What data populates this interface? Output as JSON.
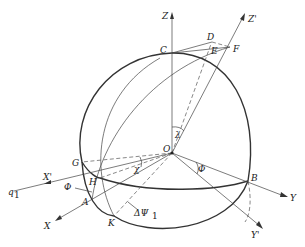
{
  "figure": {
    "type": "spherical-geometry-diagram",
    "points": {
      "O": "O",
      "A": "A",
      "B": "B",
      "C": "C",
      "D": "D",
      "E": "E",
      "F": "F",
      "G": "G",
      "H": "H",
      "K": "K"
    },
    "axes": {
      "X": "X",
      "Y": "Y",
      "Z": "Z",
      "X_prime": "X'",
      "Y_prime": "Y'",
      "Z_prime": "Z'"
    },
    "vector": {
      "q1": "q",
      "q1_sub": "1"
    },
    "angles": {
      "lambda": "λ",
      "phi_left": "Φ",
      "phi_right": "Φ",
      "chi": "χ",
      "delta_psi": "ΔΨ",
      "delta_psi_sub": "1"
    },
    "colors": {
      "line": "#333333",
      "background": "#ffffff"
    }
  }
}
